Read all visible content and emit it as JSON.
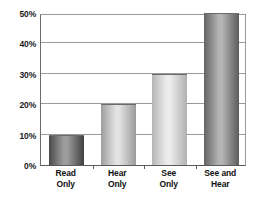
{
  "chart_data": {
    "type": "bar",
    "title": "",
    "subtitle": "",
    "xlabel": "",
    "ylabel": "",
    "categories": [
      "Read Only",
      "Hear Only",
      "See Only",
      "See and Hear"
    ],
    "category_lines": [
      [
        "Read",
        "Only"
      ],
      [
        "Hear",
        "Only"
      ],
      [
        "See",
        "Only"
      ],
      [
        "See and",
        "Hear"
      ]
    ],
    "values": [
      10,
      20,
      30,
      50
    ],
    "value_labels": [
      "10%",
      "20%",
      "30%",
      "50%"
    ],
    "ylim": [
      0,
      50
    ],
    "ytick_values": [
      0,
      10,
      20,
      30,
      40,
      50
    ],
    "ytick_labels": [
      "0%",
      "10%",
      "20%",
      "30%",
      "40%",
      "50%"
    ],
    "grid": true,
    "grid_axis": "y",
    "legend": false,
    "legend_position": "none",
    "annotations": [],
    "bar_colors": [
      "#777777",
      "#b9b9b9",
      "#c9c9c9",
      "#8e8e8e"
    ],
    "bar_gradients": [
      {
        "edge": "#4a4a4a",
        "mid": "#9d9d9d",
        "edge2": "#3f3f3f"
      },
      {
        "edge": "#9d9d9d",
        "mid": "#e3e3e3",
        "edge2": "#9a9a9a"
      },
      {
        "edge": "#b5b5b5",
        "mid": "#ececec",
        "edge2": "#b0b0b0"
      },
      {
        "edge": "#636363",
        "mid": "#b4b4b4",
        "edge2": "#5c5c5c"
      }
    ]
  },
  "axes": {
    "grid_color": "#9a9a9a",
    "frame_color": "#6d6d6d",
    "tick_text_color": "#1a1a1a",
    "label_text_color": "#111111",
    "background": "#ffffff"
  }
}
